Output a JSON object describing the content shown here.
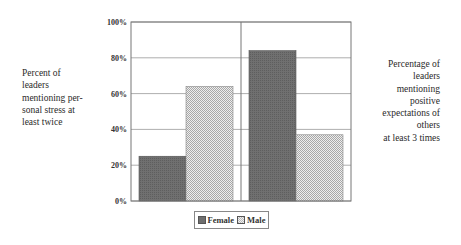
{
  "chart_data": {
    "type": "bar",
    "title": "",
    "xlabel": "",
    "ylabel": "",
    "categories": [
      "Percent of leaders mentioning personal stress at least twice",
      "Percentage of leaders mentioning positive expectations of others at least 3 times"
    ],
    "series": [
      {
        "name": "Female",
        "values": [
          25,
          84
        ],
        "color": "#6e6e6e"
      },
      {
        "name": "Male",
        "values": [
          64,
          37
        ],
        "color": "#c8c8c8"
      }
    ],
    "ylim": [
      0,
      100
    ],
    "yticks": [
      "0%",
      "20%",
      "40%",
      "60%",
      "80%",
      "100%"
    ],
    "grid": true,
    "legend": "bottom-center"
  },
  "labels": {
    "left": "Percent of leaders mentioning per-sonal stress at least twice",
    "left_lines": [
      "Percent of",
      "leaders",
      "mentioning per-",
      "sonal stress at",
      "least twice"
    ],
    "right_lines": [
      "Percentage of",
      "leaders",
      "mentioning",
      "positive",
      "expectations of",
      "others",
      "at least 3 times"
    ]
  },
  "legend": {
    "female": "Female",
    "male": "Male"
  }
}
